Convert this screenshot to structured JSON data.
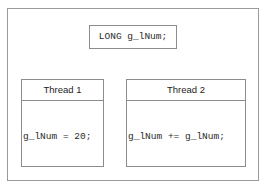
{
  "diagram": {
    "shared_declaration": {
      "code": "LONG g_lNum;"
    },
    "threads": [
      {
        "header": "Thread 1",
        "code": "g_lNum = 20;"
      },
      {
        "header": "Thread 2",
        "code": "g_lNum += g_lNum;"
      }
    ]
  },
  "colors": {
    "background": "#ffffff",
    "frame_line": "#9a9a9a",
    "box_line": "#8c8c8c",
    "code_text": "#2b2b2b",
    "header_text": "#1d1d1d"
  }
}
